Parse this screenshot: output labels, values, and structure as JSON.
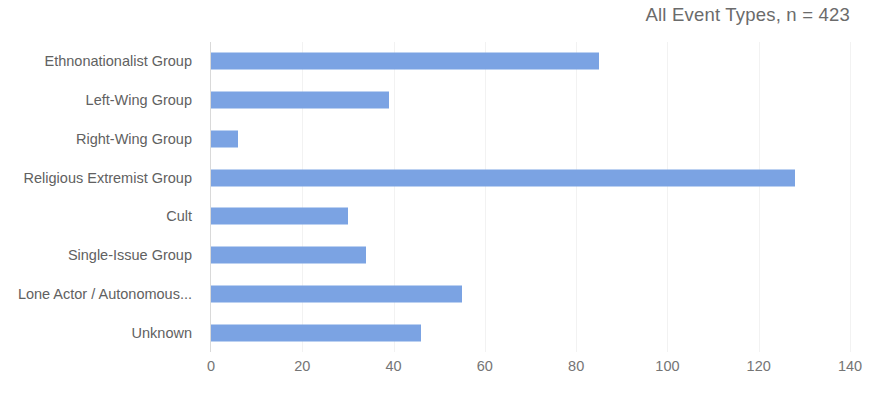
{
  "chart_data": {
    "type": "bar",
    "orientation": "horizontal",
    "title": "All Event Types, n = 423",
    "xlabel": "",
    "ylabel": "",
    "xlim": [
      0,
      140
    ],
    "xticks": [
      0,
      20,
      40,
      60,
      80,
      100,
      120,
      140
    ],
    "grid": true,
    "legend": null,
    "bar_color": "#7ba3e3",
    "categories": [
      "Ethnonationalist Group",
      "Left-Wing Group",
      "Right-Wing Group",
      "Religious Extremist Group",
      "Cult",
      "Single-Issue Group",
      "Lone Actor / Autonomous...",
      "Unknown"
    ],
    "values": [
      85,
      39,
      6,
      128,
      30,
      34,
      55,
      46
    ]
  },
  "axis": {
    "tick_labels": [
      "0",
      "20",
      "40",
      "60",
      "80",
      "100",
      "120",
      "140"
    ]
  }
}
